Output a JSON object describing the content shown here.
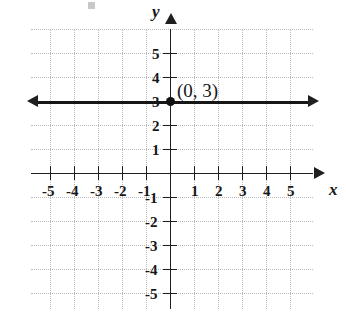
{
  "figure": {
    "kind": "coordinate-plane-graph",
    "background_color": "#ffffff",
    "ink_color": "#161616",
    "grid_color": "#bcbcbc"
  },
  "chart_data": {
    "type": "line",
    "title": "",
    "subtitle": "",
    "xlabel": "x",
    "ylabel": "y",
    "xlim": [
      -6,
      6
    ],
    "ylim": [
      -6,
      6
    ],
    "grid": true,
    "grid_step": 1,
    "legend": "none",
    "x_tick_labels": [
      "-5",
      "-4",
      "-3",
      "-2",
      "-1",
      "1",
      "2",
      "3",
      "4",
      "5"
    ],
    "x_tick_values": [
      -5,
      -4,
      -3,
      -2,
      -1,
      1,
      2,
      3,
      4,
      5
    ],
    "y_tick_labels": [
      "5",
      "4",
      "3",
      "2",
      "1",
      "-1",
      "-2",
      "-3",
      "-4",
      "-5"
    ],
    "y_tick_values": [
      5,
      4,
      3,
      2,
      1,
      -1,
      -2,
      -3,
      -4,
      -5
    ],
    "series": [
      {
        "name": "y = 3",
        "equation": "y = 3",
        "style": "solid-double-arrow",
        "color": "#161616",
        "x": [
          -6,
          6
        ],
        "values": [
          3,
          3
        ]
      }
    ],
    "points": [
      {
        "label": "(0, 3)",
        "x": 0,
        "y": 3,
        "marker": "filled-circle",
        "label_position": "upper-right"
      }
    ],
    "annotations": [
      {
        "text": "(0, 3)",
        "x": 0.25,
        "y": 3.8
      }
    ]
  },
  "axes": {
    "x_axis_label": "x",
    "y_axis_label": "y",
    "x_arrow_left": "arrow-left-icon",
    "x_arrow_right": "arrow-right-icon",
    "y_arrow_up": "arrow-up-icon"
  },
  "line_arrows": {
    "left": "arrow-left-icon",
    "right": "arrow-right-icon"
  }
}
